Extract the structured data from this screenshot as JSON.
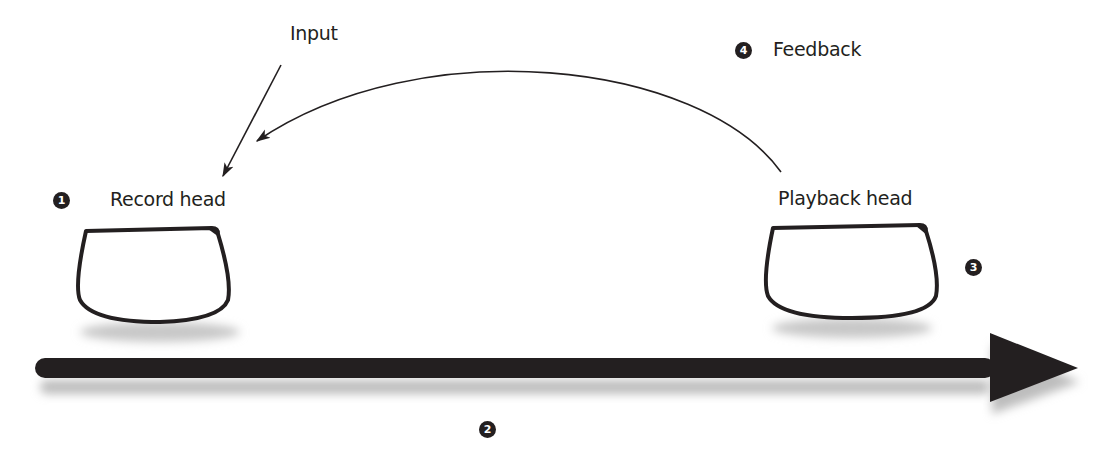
{
  "diagram": {
    "labels": {
      "input": "Input",
      "feedback": "Feedback",
      "record_head": "Record head",
      "playback_head": "Playback head"
    },
    "badges": {
      "record_head": "1",
      "tape_motion": "2",
      "playback_head": "3",
      "feedback": "4"
    },
    "colors": {
      "ink": "#231f20",
      "background": "#ffffff",
      "shadow": "#bdbdbd"
    }
  }
}
